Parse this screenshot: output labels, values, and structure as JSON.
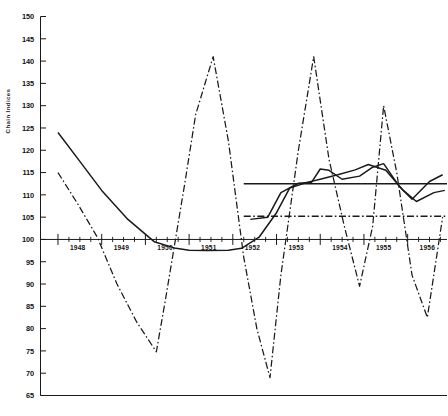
{
  "chart_data": {
    "type": "line",
    "title": "",
    "xlabel": "",
    "ylabel": "Chain Indices",
    "ylim": [
      65,
      150
    ],
    "xlim": [
      1947.6,
      1956.9
    ],
    "grid": false,
    "legend": "none",
    "yticks": [
      65,
      70,
      75,
      80,
      85,
      90,
      95,
      100,
      105,
      110,
      115,
      120,
      125,
      130,
      135,
      140,
      145,
      150
    ],
    "ytick_labels": [
      "65",
      "70",
      "75",
      "80",
      "85",
      "90",
      "95",
      "100",
      "105",
      "110",
      "115",
      "120",
      "125",
      "130",
      "135",
      "140",
      "145",
      "150"
    ],
    "xticks": [
      1948,
      1949,
      1950,
      1951,
      1952,
      1953,
      1954,
      1955,
      1956
    ],
    "xtick_labels": [
      "1948",
      "1949",
      "1950",
      "1951",
      "1952",
      "1953",
      "1954",
      "1955",
      "1956"
    ],
    "baseline_value": 100,
    "minor_xticks_per_year": 4,
    "series": [
      {
        "name": "series-a-solid",
        "style": "solid",
        "x": [
          1948.0,
          1948.5,
          1949.0,
          1949.6,
          1950.2,
          1950.7,
          1951.0,
          1951.4,
          1951.9,
          1952.2,
          1952.6,
          1953.0,
          1953.3,
          1953.7,
          1954.0,
          1954.4,
          1954.8,
          1955.1,
          1955.5,
          1955.9,
          1956.2,
          1956.6,
          1956.85
        ],
        "values": [
          124.0,
          117.5,
          111.0,
          104.5,
          99.5,
          98.0,
          97.6,
          97.5,
          97.6,
          98.0,
          100.5,
          106.0,
          111.5,
          112.8,
          113.5,
          114.5,
          115.6,
          116.8,
          115.5,
          111.0,
          108.5,
          110.5,
          111.0
        ]
      },
      {
        "name": "series-b-solid-upper",
        "style": "solid",
        "x": [
          1952.4,
          1952.8,
          1953.1,
          1953.5,
          1953.8,
          1954.0,
          1954.2,
          1954.5,
          1954.9,
          1955.2,
          1955.45,
          1955.8,
          1956.1,
          1956.5,
          1956.8
        ],
        "values": [
          104.5,
          105.0,
          110.5,
          112.6,
          112.8,
          115.8,
          115.5,
          113.5,
          114.2,
          116.2,
          117.0,
          112.0,
          109.0,
          113.0,
          114.5
        ]
      },
      {
        "name": "series-c-dashdot",
        "style": "dashdot",
        "x": [
          1948.0,
          1948.45,
          1948.9,
          1949.35,
          1949.8,
          1950.25,
          1950.45,
          1950.9,
          1951.15,
          1951.55,
          1951.9,
          1952.25,
          1952.55,
          1952.85,
          1953.1,
          1953.5,
          1953.85,
          1954.2,
          1954.55,
          1954.9,
          1955.2,
          1955.45,
          1955.75,
          1956.1,
          1956.45,
          1956.8
        ],
        "values": [
          115.0,
          108.0,
          100.5,
          90.0,
          81.5,
          74.8,
          86.0,
          112.5,
          128.0,
          141.0,
          122.0,
          96.0,
          80.0,
          69.0,
          92.0,
          120.0,
          141.0,
          118.0,
          103.0,
          89.5,
          103.0,
          130.0,
          115.0,
          92.0,
          82.5,
          105.0
        ]
      }
    ],
    "reference_lines": [
      {
        "name": "upper-reference-line",
        "style": "solid",
        "value": 112.5,
        "x_start": 1952.25,
        "x_end": 1956.9
      },
      {
        "name": "lower-reference-line",
        "style": "dashdot",
        "value": 105.2,
        "x_start": 1952.25,
        "x_end": 1956.9
      }
    ],
    "axis_line_color": "#1a1a1a",
    "series_color": "#1a1a1a"
  }
}
